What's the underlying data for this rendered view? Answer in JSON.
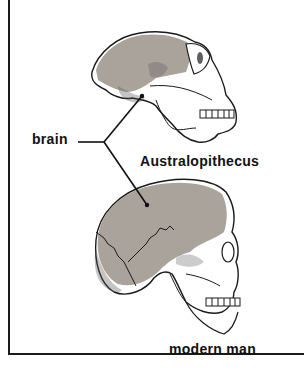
{
  "labels": {
    "brain": "brain",
    "australopithecus": "Australopithecus",
    "modern_man": "modern man"
  },
  "colors": {
    "brain_fill": "#aaa39c",
    "outline": "#1a1a1a",
    "background": "#ffffff"
  }
}
